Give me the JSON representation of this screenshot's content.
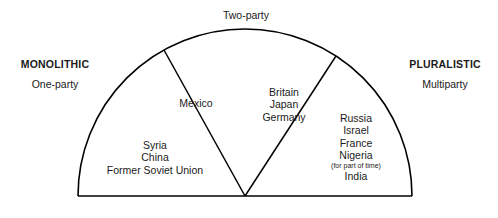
{
  "diagram": {
    "type": "semicircle-spectrum",
    "top_label": "Two-party",
    "poles": {
      "left": {
        "title": "MONOLITHIC",
        "subtitle": "One-party"
      },
      "right": {
        "title": "PLURALISTIC",
        "subtitle": "Multiparty"
      }
    },
    "sectors": [
      {
        "id": "monolithic",
        "position": "left",
        "entries": [
          "Syria",
          "China",
          "Former Soviet Union"
        ]
      },
      {
        "id": "two-party",
        "position": "center",
        "entries": [
          "Britain",
          "Japan",
          "Germany"
        ]
      },
      {
        "id": "pluralistic",
        "position": "right",
        "entries": [
          "Russia",
          "Israel",
          "France",
          "Nigeria",
          "India"
        ],
        "annotation": "(for part of time)",
        "annotation_after": "Nigeria"
      }
    ],
    "callouts": [
      {
        "id": "mexico",
        "text": "Mexico"
      }
    ],
    "colors": {
      "stroke": "#000000",
      "text": "#1a1a1a",
      "background": "#ffffff"
    },
    "geometry": {
      "center_x": 245,
      "baseline_y": 196,
      "radius": 167,
      "divider_angles_deg": [
        119,
        57
      ]
    }
  }
}
